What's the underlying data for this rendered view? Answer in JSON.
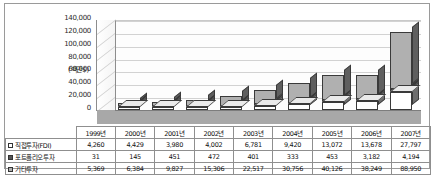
{
  "chart_data": {
    "type": "bar",
    "subtype": "stacked-column-3d",
    "title": "",
    "xlabel": "",
    "ylabel": "(백만$)",
    "ylim": [
      0,
      140000
    ],
    "ytick_values": [
      0,
      20000,
      40000,
      60000,
      80000,
      100000,
      120000,
      140000
    ],
    "ytick_labels": [
      "0",
      "20,000",
      "40,000",
      "60,000",
      "80,000",
      "100,000",
      "120,000",
      "140,000"
    ],
    "grid": true,
    "legend_position": "table",
    "categories": [
      "1999년",
      "2000년",
      "2001년",
      "2002년",
      "2003년",
      "2004년",
      "2005년",
      "2006년",
      "2007년"
    ],
    "series": [
      {
        "name": "직접투자(FDI)",
        "swatch": "white",
        "values": [
          4260,
          4429,
          3980,
          4002,
          6781,
          9420,
          13072,
          13678,
          27797
        ],
        "labels": [
          "4,260",
          "4,429",
          "3,980",
          "4,002",
          "6,781",
          "9,420",
          "13,072",
          "13,678",
          "27,797"
        ]
      },
      {
        "name": "포트폴리오투자",
        "swatch": "dark",
        "values": [
          31,
          145,
          451,
          472,
          401,
          333,
          453,
          3182,
          4194
        ],
        "labels": [
          "31",
          "145",
          "451",
          "472",
          "401",
          "333",
          "453",
          "3,182",
          "4,194"
        ]
      },
      {
        "name": "기타투자",
        "swatch": "gray",
        "values": [
          5369,
          6384,
          9827,
          15306,
          22517,
          30756,
          40126,
          38249,
          88950
        ],
        "labels": [
          "5,369",
          "6,384",
          "9,827",
          "15,306",
          "22,517",
          "30,756",
          "40,126",
          "38,249",
          "88,950"
        ]
      }
    ],
    "totals": [
      9660,
      10958,
      14258,
      19780,
      29699,
      40509,
      53651,
      55109,
      120941
    ]
  },
  "table": {
    "corner_label": "",
    "column_headers": [
      "1999년",
      "2000년",
      "2001년",
      "2002년",
      "2003년",
      "2004년",
      "2005년",
      "2006년",
      "2007년"
    ],
    "rows": [
      {
        "label": "직접투자(FDI)",
        "cells": [
          "4,260",
          "4,429",
          "3,980",
          "4,002",
          "6,781",
          "9,420",
          "13,072",
          "13,678",
          "27,797"
        ]
      },
      {
        "label": "포트폴리오투자",
        "cells": [
          "31",
          "145",
          "451",
          "472",
          "401",
          "333",
          "453",
          "3,182",
          "4,194"
        ]
      },
      {
        "label": "기타투자",
        "cells": [
          "5,369",
          "6,384",
          "9,827",
          "15,306",
          "22,517",
          "30,756",
          "40,126",
          "38,249",
          "88,950"
        ]
      }
    ]
  },
  "colors": {
    "fdi": "#ffffff",
    "portfolio": "#555555",
    "other": "#b0b0b0",
    "grid": "#d2d2d2",
    "axis": "#8d8d8d",
    "floor": "#a8a8a8"
  }
}
